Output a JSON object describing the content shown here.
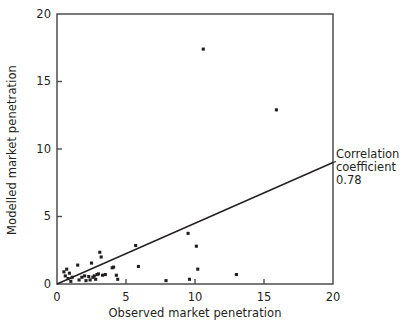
{
  "chart_data": {
    "type": "scatter",
    "title": "",
    "subtitle": "",
    "xlabel": "Observed market penetration",
    "ylabel": "Modelled market penetration",
    "xlim": [
      0,
      20
    ],
    "ylim": [
      0,
      20
    ],
    "xticks": [
      0,
      5,
      10,
      15,
      20
    ],
    "yticks": [
      0,
      5,
      10,
      15,
      20
    ],
    "xtick_labels": [
      "0",
      "5",
      "10",
      "15",
      "20"
    ],
    "ytick_labels": [
      "0",
      "5",
      "10",
      "15",
      "20"
    ],
    "grid": false,
    "legend": null,
    "marker_color": "#231f20",
    "marker_size": 3.1,
    "axis_color": "#4d4d4d",
    "points": [
      [
        0.5,
        0.9
      ],
      [
        0.6,
        0.6
      ],
      [
        0.7,
        1.1
      ],
      [
        0.8,
        0.4
      ],
      [
        0.9,
        0.8
      ],
      [
        1.0,
        0.2
      ],
      [
        1.1,
        0.5
      ],
      [
        1.5,
        1.4
      ],
      [
        1.6,
        0.3
      ],
      [
        1.8,
        0.5
      ],
      [
        2.0,
        0.6
      ],
      [
        2.1,
        0.25
      ],
      [
        2.3,
        0.55
      ],
      [
        2.4,
        0.3
      ],
      [
        2.5,
        1.55
      ],
      [
        2.6,
        0.5
      ],
      [
        2.7,
        0.6
      ],
      [
        2.8,
        0.35
      ],
      [
        2.9,
        0.7
      ],
      [
        3.0,
        0.75
      ],
      [
        3.1,
        2.35
      ],
      [
        3.2,
        2.0
      ],
      [
        3.3,
        0.65
      ],
      [
        3.5,
        0.7
      ],
      [
        4.0,
        1.2
      ],
      [
        4.1,
        1.25
      ],
      [
        4.3,
        0.65
      ],
      [
        4.4,
        0.35
      ],
      [
        5.7,
        2.85
      ],
      [
        5.9,
        1.3
      ],
      [
        7.9,
        0.25
      ],
      [
        9.5,
        3.75
      ],
      [
        9.6,
        0.35
      ],
      [
        10.1,
        2.8
      ],
      [
        10.2,
        1.1
      ],
      [
        10.6,
        17.4
      ],
      [
        13.0,
        0.7
      ],
      [
        15.9,
        12.9
      ]
    ],
    "trend_line": {
      "label": "Correlation coefficient 0.78",
      "x0": 0.0,
      "y0": 0.0,
      "x1": 20.0,
      "y1": 9.0,
      "color": "#231f20"
    },
    "annotation": {
      "line1": "Correlation",
      "line2": "coefficient",
      "line3": "0.78"
    }
  }
}
